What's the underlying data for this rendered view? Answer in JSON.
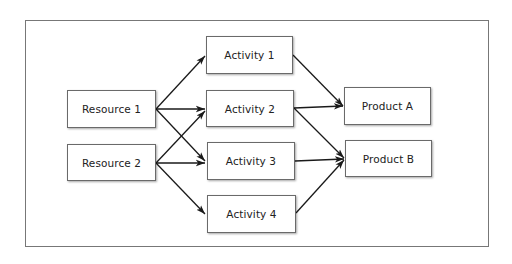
{
  "diagram": {
    "type": "flow",
    "resources": [
      {
        "id": "r1",
        "label": "Resource 1"
      },
      {
        "id": "r2",
        "label": "Resource 2"
      }
    ],
    "activities": [
      {
        "id": "a1",
        "label": "Activity 1"
      },
      {
        "id": "a2",
        "label": "Activity 2"
      },
      {
        "id": "a3",
        "label": "Activity 3"
      },
      {
        "id": "a4",
        "label": "Activity 4"
      }
    ],
    "products": [
      {
        "id": "pa",
        "label": "Product A"
      },
      {
        "id": "pb",
        "label": "Product B"
      }
    ],
    "edges": [
      [
        "Resource 1",
        "Activity 1"
      ],
      [
        "Resource 1",
        "Activity 2"
      ],
      [
        "Resource 1",
        "Activity 3"
      ],
      [
        "Resource 2",
        "Activity 2"
      ],
      [
        "Resource 2",
        "Activity 3"
      ],
      [
        "Resource 2",
        "Activity 4"
      ],
      [
        "Activity 1",
        "Product A"
      ],
      [
        "Activity 2",
        "Product A"
      ],
      [
        "Activity 2",
        "Product B"
      ],
      [
        "Activity 3",
        "Product B"
      ],
      [
        "Activity 4",
        "Product B"
      ]
    ],
    "colors": {
      "arrow": "#1a1a1a",
      "border": "#6a6a6a",
      "frame": "#777777"
    }
  }
}
